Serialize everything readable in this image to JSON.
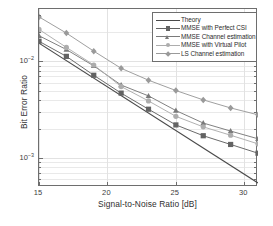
{
  "chart_data": {
    "type": "line",
    "title": "",
    "xlabel": "Signal-to-Noise Ratio [dB]",
    "ylabel": "Bit Error Ratio",
    "xlim": [
      15,
      31
    ],
    "ylim": [
      0.0005,
      0.035
    ],
    "yscale": "log",
    "xticks": [
      15,
      20,
      25,
      30
    ],
    "xticklabels": [
      "15",
      "20",
      "25",
      "30"
    ],
    "yticks": [
      0.01,
      0.001
    ],
    "yticklabels": [
      "10-2",
      "10-3"
    ],
    "grid": true,
    "legend_position": "upper right",
    "x": [
      15,
      17,
      19,
      21,
      23,
      25,
      27,
      29,
      31
    ],
    "series": [
      {
        "name": "Theory",
        "marker": "none",
        "color": "#4a4a4a",
        "x": [
          15,
          31
        ],
        "values": [
          0.0155,
          0.00055
        ]
      },
      {
        "name": "MMSE with Perfect CSI",
        "marker": "square",
        "color": "#636363",
        "values": [
          0.0162,
          0.0113,
          0.0072,
          0.0047,
          0.0032,
          0.0022,
          0.0017,
          0.00138,
          0.00112
        ]
      },
      {
        "name": "MMSE Channel estimation",
        "marker": "triangle",
        "color": "#7a7a7a",
        "values": [
          0.0185,
          0.0133,
          0.009,
          0.0057,
          0.0044,
          0.0031,
          0.0023,
          0.0019,
          0.00158
        ]
      },
      {
        "name": "MMSE with Virtual Pilot",
        "marker": "circle",
        "color": "#adadad",
        "values": [
          0.0215,
          0.014,
          0.0092,
          0.0055,
          0.0039,
          0.0027,
          0.0021,
          0.00172,
          0.0014
        ]
      },
      {
        "name": "LS Channel estimation",
        "marker": "diamond",
        "color": "#9a9a9a",
        "values": [
          0.029,
          0.0197,
          0.0128,
          0.0085,
          0.0064,
          0.005,
          0.004,
          0.0033,
          0.0028
        ]
      }
    ]
  },
  "axes": {
    "box_color": "#6e6e6e",
    "grid_color": "#e2e2e2",
    "background": "#ffffff"
  }
}
